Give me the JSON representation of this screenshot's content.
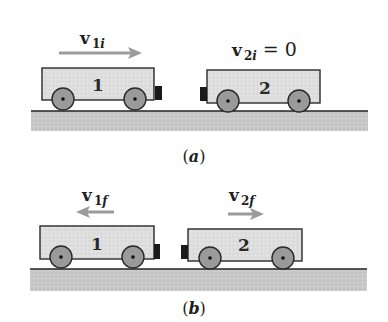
{
  "figure": {
    "panels": [
      {
        "label_open": "(",
        "label_letter": "a",
        "label_close": ")",
        "velocity_labels": [
          {
            "symbol": "v",
            "subscript_num": "1",
            "subscript_var": "i",
            "suffix": "",
            "direction": "right"
          },
          {
            "symbol": "v",
            "subscript_num": "2",
            "subscript_var": "i",
            "suffix": "= 0",
            "direction": "none"
          }
        ],
        "carts": [
          {
            "number": "1",
            "bumper_side": "right"
          },
          {
            "number": "2",
            "bumper_side": "left"
          }
        ]
      },
      {
        "label_open": "(",
        "label_letter": "b",
        "label_close": ")",
        "velocity_labels": [
          {
            "symbol": "v",
            "subscript_num": "1",
            "subscript_var": "f",
            "suffix": "",
            "direction": "left"
          },
          {
            "symbol": "v",
            "subscript_num": "2",
            "subscript_var": "f",
            "suffix": "",
            "direction": "right"
          }
        ],
        "carts": [
          {
            "number": "1",
            "bumper_side": "right"
          },
          {
            "number": "2",
            "bumper_side": "left"
          }
        ]
      }
    ],
    "colors": {
      "cart_body": "#dcdcdc",
      "cart_outline": "#2a2a2a",
      "wheel": "#9a9a9a",
      "bumper": "#1a1a1a",
      "ground": "#c8c8c8",
      "ground_line": "#222222",
      "arrow": "#9b9b9b"
    }
  }
}
